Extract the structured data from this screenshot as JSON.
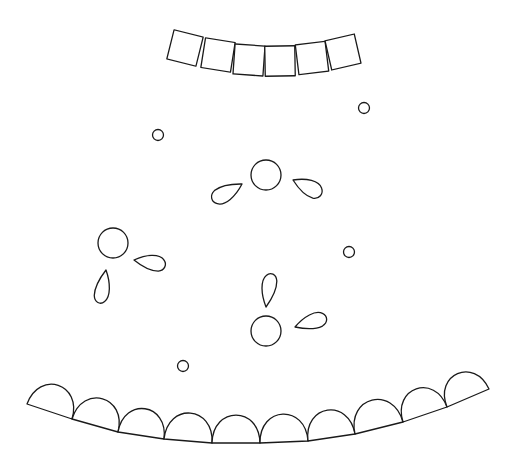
{
  "diagram": {
    "width": 512,
    "height": 469,
    "background": "#ffffff",
    "stroke_color": "#1a1a1a",
    "top_squares": [
      {
        "cx": 185,
        "cy": 48,
        "size": 30,
        "rotate": 14
      },
      {
        "cx": 218,
        "cy": 55,
        "size": 30,
        "rotate": 9
      },
      {
        "cx": 249,
        "cy": 60,
        "size": 30,
        "rotate": 4
      },
      {
        "cx": 280,
        "cy": 61,
        "size": 30,
        "rotate": -1
      },
      {
        "cx": 312,
        "cy": 58,
        "size": 30,
        "rotate": -7
      },
      {
        "cx": 343,
        "cy": 52,
        "size": 30,
        "rotate": -13
      }
    ],
    "small_circles": [
      {
        "cx": 158,
        "cy": 135,
        "r": 5.5
      },
      {
        "cx": 364,
        "cy": 108,
        "r": 5.5
      },
      {
        "cx": 349,
        "cy": 252,
        "r": 5.5
      },
      {
        "cx": 183,
        "cy": 366,
        "r": 5.5
      }
    ],
    "large_circles": [
      {
        "cx": 266,
        "cy": 175,
        "r": 15
      },
      {
        "cx": 113,
        "cy": 243,
        "r": 15
      },
      {
        "cx": 266,
        "cy": 331,
        "r": 15
      }
    ],
    "teardrops": [
      {
        "tip_x": 242,
        "tip_y": 184,
        "len": 34,
        "width": 17,
        "angle": 150
      },
      {
        "tip_x": 293,
        "tip_y": 180,
        "len": 32,
        "width": 17,
        "angle": 25
      },
      {
        "tip_x": 134,
        "tip_y": 260,
        "len": 32,
        "width": 16,
        "angle": 8
      },
      {
        "tip_x": 106,
        "tip_y": 270,
        "len": 34,
        "width": 15,
        "angle": 100
      },
      {
        "tip_x": 266,
        "tip_y": 307,
        "len": 34,
        "width": 15,
        "angle": -82
      },
      {
        "tip_x": 295,
        "tip_y": 327,
        "len": 33,
        "width": 16,
        "angle": -18
      }
    ],
    "bottom_domes": [
      {
        "x1": 27,
        "y1": 404,
        "x2": 72,
        "y2": 419
      },
      {
        "x1": 72,
        "y1": 419,
        "x2": 118,
        "y2": 432
      },
      {
        "x1": 118,
        "y1": 432,
        "x2": 164,
        "y2": 439
      },
      {
        "x1": 164,
        "y1": 439,
        "x2": 212,
        "y2": 443
      },
      {
        "x1": 212,
        "y1": 443,
        "x2": 260,
        "y2": 443
      },
      {
        "x1": 260,
        "y1": 443,
        "x2": 308,
        "y2": 441
      },
      {
        "x1": 308,
        "y1": 441,
        "x2": 355,
        "y2": 434
      },
      {
        "x1": 355,
        "y1": 434,
        "x2": 403,
        "y2": 422
      },
      {
        "x1": 403,
        "y1": 422,
        "x2": 447,
        "y2": 407
      },
      {
        "x1": 447,
        "y1": 407,
        "x2": 489,
        "y2": 389
      }
    ]
  }
}
